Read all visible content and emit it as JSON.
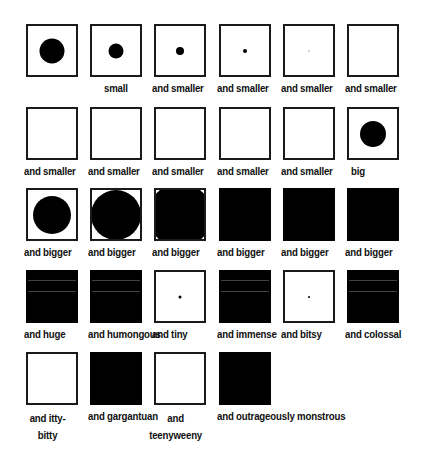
{
  "grid": {
    "cells": [
      {
        "label": "",
        "style": "dot",
        "dot_size": 25,
        "col": 0,
        "row": 0
      },
      {
        "label": "small",
        "style": "dot",
        "dot_size": 15,
        "col": 1,
        "row": 0
      },
      {
        "label": "and smaller",
        "style": "dot",
        "dot_size": 8,
        "col": 2,
        "row": 0
      },
      {
        "label": "and smaller",
        "style": "dot",
        "dot_size": 4,
        "col": 3,
        "row": 0
      },
      {
        "label": "and smaller",
        "style": "dot",
        "dot_size": 1,
        "col": 4,
        "row": 0
      },
      {
        "label": "and smaller",
        "style": "empty",
        "dot_size": 0,
        "col": 5,
        "row": 0
      },
      {
        "label": "and smaller",
        "style": "empty",
        "dot_size": 0,
        "col": 0,
        "row": 1
      },
      {
        "label": "and smaller",
        "style": "empty",
        "dot_size": 0,
        "col": 1,
        "row": 1
      },
      {
        "label": "and smaller",
        "style": "empty",
        "dot_size": 0,
        "col": 2,
        "row": 1
      },
      {
        "label": "and smaller",
        "style": "empty",
        "dot_size": 0,
        "col": 3,
        "row": 1
      },
      {
        "label": "and smaller",
        "style": "empty",
        "dot_size": 0,
        "col": 4,
        "row": 1
      },
      {
        "label": "big",
        "style": "dot",
        "dot_size": 26,
        "col": 5,
        "row": 1
      },
      {
        "label": "and bigger",
        "style": "dot",
        "dot_size": 38,
        "col": 0,
        "row": 2
      },
      {
        "label": "and bigger",
        "style": "dot",
        "dot_size": 50,
        "col": 1,
        "row": 2
      },
      {
        "label": "and bigger",
        "style": "dot",
        "dot_size": 64,
        "col": 2,
        "row": 2
      },
      {
        "label": "and bigger",
        "style": "filled",
        "dot_size": 0,
        "col": 3,
        "row": 2
      },
      {
        "label": "and bigger",
        "style": "filled",
        "dot_size": 0,
        "col": 4,
        "row": 2
      },
      {
        "label": "and bigger",
        "style": "filled",
        "dot_size": 0,
        "col": 5,
        "row": 2
      },
      {
        "label": "and huge",
        "style": "striped",
        "dot_size": 0,
        "col": 0,
        "row": 3
      },
      {
        "label": "and humongous",
        "style": "striped",
        "dot_size": 0,
        "col": 1,
        "row": 3
      },
      {
        "label": "and tiny",
        "style": "dot",
        "dot_size": 3,
        "col": 2,
        "row": 3
      },
      {
        "label": "and immense",
        "style": "striped",
        "dot_size": 0,
        "col": 3,
        "row": 3
      },
      {
        "label": "and bitsy",
        "style": "dot",
        "dot_size": 2,
        "col": 4,
        "row": 3
      },
      {
        "label": "and colossal",
        "style": "striped",
        "dot_size": 0,
        "col": 5,
        "row": 3
      },
      {
        "label": "and itty-bitty",
        "style": "empty",
        "dot_size": 0,
        "col": 0,
        "row": 4,
        "wrap": true
      },
      {
        "label": "and gargantuan",
        "style": "filled",
        "dot_size": 0,
        "col": 1,
        "row": 4
      },
      {
        "label": "and teenyweeny",
        "style": "empty",
        "dot_size": 0,
        "col": 2,
        "row": 4,
        "wrap": true
      },
      {
        "label": "and outrageously monstrous",
        "style": "filled",
        "dot_size": 0,
        "col": 3,
        "row": 4
      }
    ],
    "col_x": [
      26,
      90,
      154,
      219,
      283,
      347
    ],
    "row_y": [
      24,
      107,
      188,
      270,
      352
    ]
  },
  "colors": {
    "fill": "#000000",
    "border": "#1a1a1a",
    "background": "#ffffff"
  }
}
